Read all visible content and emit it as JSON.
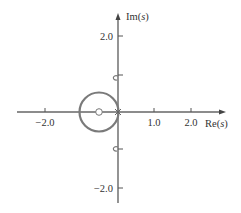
{
  "diagram": {
    "type": "root-locus",
    "axes": {
      "x_label_prefix": "Re(",
      "x_label_var": "s",
      "x_label_suffix": ")",
      "y_label_prefix": "Im(",
      "y_label_var": "s",
      "y_label_suffix": ")",
      "x_ticks": [
        {
          "value": -2.0,
          "label": "−2.0"
        },
        {
          "value": 1.0,
          "label": "1.0"
        },
        {
          "value": 2.0,
          "label": "2.0"
        }
      ],
      "y_ticks": [
        {
          "value": 2.0,
          "label": "2.0"
        },
        {
          "value": -2.0,
          "label": "−2.0"
        }
      ]
    },
    "locus_circle": {
      "center_re": -0.5,
      "center_im": 0.0,
      "radius": 0.52
    },
    "zeros": [
      {
        "re": -0.5,
        "im": 0.0
      }
    ],
    "poles": [
      {
        "re": 0.0,
        "im": 0.0
      }
    ],
    "imaginary_axis_marks": [
      {
        "im": 1.0
      },
      {
        "im": -1.0
      }
    ],
    "colors": {
      "axis": "#555555",
      "locus": "#7a7a7a",
      "text": "#333333"
    }
  }
}
